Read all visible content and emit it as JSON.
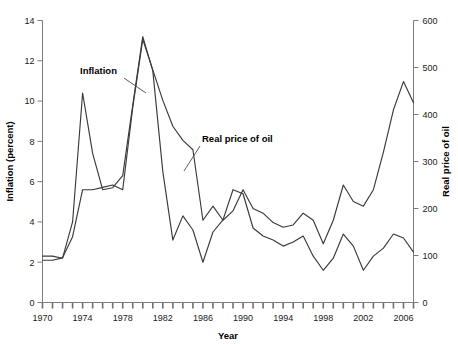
{
  "chart_data": {
    "type": "line",
    "title": "",
    "xlabel": "Year",
    "ylabel": "Inflation (percent)",
    "y2label": "Real price of oil",
    "grid": false,
    "legend_position": "inline-annotations",
    "xlim": [
      1970,
      2007
    ],
    "ylim": [
      0,
      14
    ],
    "y2lim": [
      0,
      600
    ],
    "xticks": [
      1970,
      1971,
      1972,
      1973,
      1974,
      1975,
      1976,
      1977,
      1978,
      1979,
      1980,
      1981,
      1982,
      1983,
      1984,
      1985,
      1986,
      1987,
      1988,
      1989,
      1990,
      1991,
      1992,
      1993,
      1994,
      1995,
      1996,
      1997,
      1998,
      1999,
      2000,
      2001,
      2002,
      2003,
      2004,
      2005,
      2006,
      2007
    ],
    "xtick_labels": [
      "1970",
      "1974",
      "1978",
      "1982",
      "1986",
      "1990",
      "1994",
      "1998",
      "2002",
      "2006"
    ],
    "xtick_label_values": [
      1970,
      1974,
      1978,
      1982,
      1986,
      1990,
      1994,
      1998,
      2002,
      2006
    ],
    "yticks": [
      0,
      2,
      4,
      6,
      8,
      10,
      12,
      14
    ],
    "ytick_labels": [
      "0",
      "2",
      "4",
      "6",
      "8",
      "10",
      "12",
      "14"
    ],
    "y2ticks": [
      0,
      100,
      200,
      300,
      400,
      500,
      600
    ],
    "y2tick_labels": [
      "0",
      "100",
      "200",
      "300",
      "400",
      "500",
      "600"
    ],
    "x": [
      1970,
      1971,
      1972,
      1973,
      1974,
      1975,
      1976,
      1977,
      1978,
      1979,
      1980,
      1981,
      1982,
      1983,
      1984,
      1985,
      1986,
      1987,
      1988,
      1989,
      1990,
      1991,
      1992,
      1993,
      1994,
      1995,
      1996,
      1997,
      1998,
      1999,
      2000,
      2001,
      2002,
      2003,
      2004,
      2005,
      2006,
      2007
    ],
    "series": [
      {
        "name": "Inflation",
        "axis": "left",
        "unit": "percent",
        "values": [
          2.3,
          2.3,
          2.2,
          4.0,
          10.4,
          7.4,
          5.6,
          5.7,
          6.3,
          9.8,
          13.2,
          11.5,
          6.5,
          3.1,
          4.3,
          3.6,
          2.0,
          3.5,
          4.1,
          5.6,
          5.4,
          3.7,
          3.3,
          3.1,
          2.8,
          3.0,
          3.3,
          2.3,
          1.6,
          2.2,
          3.4,
          2.8,
          1.6,
          2.3,
          2.7,
          3.4,
          3.2,
          2.5
        ]
      },
      {
        "name": "Real price of oil",
        "axis": "right",
        "unit": "index",
        "values": [
          90,
          90,
          95,
          140,
          240,
          240,
          245,
          250,
          240,
          415,
          560,
          495,
          430,
          375,
          345,
          325,
          175,
          205,
          175,
          195,
          240,
          200,
          190,
          170,
          160,
          165,
          190,
          175,
          125,
          175,
          250,
          215,
          205,
          240,
          320,
          410,
          470,
          425
        ]
      }
    ],
    "annotations": [
      {
        "text": "Inflation",
        "target_series": "Inflation"
      },
      {
        "text": "Real price of oil",
        "target_series": "Real price of oil"
      }
    ]
  },
  "axes": {
    "left_title": "Inflation (percent)",
    "right_title": "Real price of oil",
    "bottom_title": "Year"
  },
  "colors": {
    "line": "#3a3a3a",
    "axis": "#7d7d7d",
    "text": "#000000",
    "background": "#ffffff"
  }
}
